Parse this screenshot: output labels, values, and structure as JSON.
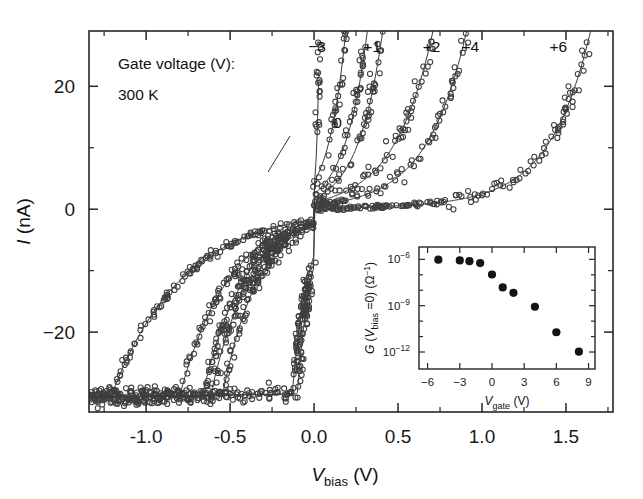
{
  "figure": {
    "temperature_label": "300 K",
    "legend_title": "Gate voltage (V):",
    "zero_label": "0"
  },
  "chart_data": {
    "type": "scatter",
    "title": "",
    "xlabel": "V_bias (V)",
    "xlabel_parts": {
      "main": "V",
      "sub": "bias",
      "unit": "(V)"
    },
    "ylabel": "I (nA)",
    "ylabel_parts": {
      "main": "I",
      "unit": "(nA)"
    },
    "xlim": [
      -1.34,
      1.78
    ],
    "ylim": [
      -33,
      29
    ],
    "xticks": [
      -1.0,
      -0.5,
      0.0,
      0.5,
      1.0,
      1.5
    ],
    "xticklabels": [
      "-1.0",
      "-0.5",
      "0.0",
      "0.5",
      "1.0",
      "1.5"
    ],
    "xticks_minor": [
      -1.25,
      -0.75,
      -0.25,
      0.25,
      0.75,
      1.25,
      1.75
    ],
    "yticks": [
      20,
      0,
      -20
    ],
    "yticklabels": [
      "20",
      "0",
      "-20"
    ],
    "yticks_minor": [
      10,
      -10
    ],
    "grid": false,
    "legend_position": "top-inside",
    "marker_style": "open-circle",
    "series": [
      {
        "name": "-3",
        "label": "-3",
        "label_x": 0.018,
        "label_y": 25.6,
        "v0": -1.21,
        "vth": 0.03,
        "sharp": 0.016,
        "scatter": 0.55,
        "npts": 150
      },
      {
        "name": "0",
        "label": "0",
        "label_x": 0.14,
        "label_y": 13.2,
        "v0": -0.8,
        "vth": 0.175,
        "sharp": 0.105,
        "scatter": 0.8,
        "npts": 150
      },
      {
        "name": "+1",
        "label": "+1",
        "label_x": 0.345,
        "label_y": 25.6,
        "v0": -0.665,
        "vth": 0.3,
        "sharp": 0.135,
        "scatter": 1.0,
        "npts": 160
      },
      {
        "name": "+1b",
        "label": "",
        "label_x": 0,
        "label_y": 0,
        "v0": -0.615,
        "vth": 0.39,
        "sharp": 0.15,
        "scatter": 1.1,
        "npts": 160
      },
      {
        "name": "+2",
        "label": "+2",
        "label_x": 0.7,
        "label_y": 25.6,
        "v0": -0.545,
        "vth": 0.68,
        "sharp": 0.23,
        "scatter": 1.2,
        "npts": 170
      },
      {
        "name": "+4",
        "label": "+4",
        "label_x": 0.93,
        "label_y": 25.6,
        "v0": -0.13,
        "vth": 0.88,
        "sharp": 0.24,
        "scatter": 1.1,
        "npts": 170
      },
      {
        "name": "+6",
        "label": "+6",
        "label_x": 1.455,
        "label_y": 25.6,
        "v0": -0.1,
        "vth": 1.62,
        "sharp": 0.245,
        "scatter": 1.3,
        "npts": 190
      }
    ]
  },
  "inset": {
    "type": "scatter",
    "xlabel": "V_gate (V)",
    "xlabel_parts": {
      "main": "V",
      "sub": "gate",
      "unit": "(V)"
    },
    "ylabel": "G (V_bias =0) (Ω⁻¹)",
    "ylabel_parts": {
      "g": "G (",
      "v": "V",
      "sub": "bias",
      "eq": " =0) (Ω",
      "sup": "-1",
      "close": ")"
    },
    "xlim": [
      -6.8,
      9.6
    ],
    "ylim_log": [
      -13.1,
      -5.2
    ],
    "xticks": [
      -6,
      -3,
      0,
      3,
      6,
      9
    ],
    "xticklabels": [
      "-6",
      "-3",
      "0",
      "3",
      "6",
      "9"
    ],
    "xticks_minor": [
      -4.5,
      -1.5,
      1.5,
      4.5,
      7.5
    ],
    "yticks_log": [
      -6,
      -9,
      -12
    ],
    "yticklabels": [
      "10-6",
      "10-9",
      "10-12"
    ],
    "yticklabel_parts": [
      {
        "base": "10",
        "exp": "-6"
      },
      {
        "base": "10",
        "exp": "-9"
      },
      {
        "base": "10",
        "exp": "-12"
      }
    ],
    "yticks_minor_log": [
      -7,
      -8,
      -10,
      -11
    ],
    "marker_style": "filled-circle",
    "points": [
      {
        "x": -5.0,
        "y_log": -6.02
      },
      {
        "x": -3.0,
        "y_log": -6.07
      },
      {
        "x": -2.1,
        "y_log": -6.12
      },
      {
        "x": -1.1,
        "y_log": -6.24
      },
      {
        "x": 0.0,
        "y_log": -6.98
      },
      {
        "x": 1.0,
        "y_log": -7.82
      },
      {
        "x": 2.0,
        "y_log": -8.17
      },
      {
        "x": 4.0,
        "y_log": -9.07
      },
      {
        "x": 6.0,
        "y_log": -10.72
      },
      {
        "x": 8.1,
        "y_log": -11.98
      }
    ]
  },
  "colors": {
    "axis": "#262626",
    "marker": "#3f3f3f",
    "line": "#3a3a3a",
    "inset_marker": "#141414",
    "background": "#ffffff"
  }
}
